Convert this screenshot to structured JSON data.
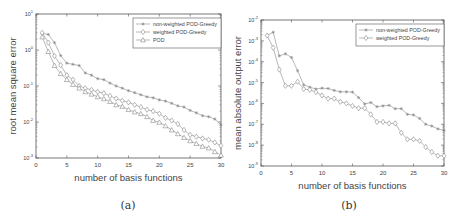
{
  "captions": {
    "a": "(a)",
    "b": "(b)"
  },
  "colors": {
    "axis": "#555555",
    "series": "#8a8a8a",
    "text": "#444444"
  },
  "chart_data": [
    {
      "id": "a",
      "type": "line",
      "yscale": "log",
      "title": "",
      "xlabel": "number of basis functions",
      "ylabel": "root mean square error",
      "xlim": [
        0,
        30
      ],
      "ylim": [
        0.001,
        10
      ],
      "xticks": [
        0,
        5,
        10,
        15,
        20,
        25,
        30
      ],
      "yticks": [
        {
          "value": 0.001,
          "label": "10",
          "exp": "-3"
        },
        {
          "value": 0.01,
          "label": "10",
          "exp": "-2"
        },
        {
          "value": 0.1,
          "label": "10",
          "exp": "-1"
        },
        {
          "value": 1,
          "label": "10",
          "exp": "0"
        },
        {
          "value": 10,
          "label": "10",
          "exp": "1"
        }
      ],
      "grid": false,
      "legend_position": "upper right",
      "x": [
        1,
        2,
        3,
        4,
        5,
        6,
        7,
        8,
        9,
        10,
        11,
        12,
        13,
        14,
        15,
        16,
        17,
        18,
        19,
        20,
        21,
        22,
        23,
        24,
        25,
        26,
        27,
        28,
        29,
        30
      ],
      "series": [
        {
          "name": "non-weighted POD-Greedy",
          "marker": "asterisk",
          "values": [
            2.9,
            2.7,
            1.6,
            0.7,
            0.43,
            0.4,
            0.37,
            0.23,
            0.2,
            0.16,
            0.15,
            0.12,
            0.1,
            0.087,
            0.074,
            0.065,
            0.057,
            0.05,
            0.047,
            0.041,
            0.038,
            0.033,
            0.028,
            0.026,
            0.021,
            0.018,
            0.015,
            0.014,
            0.012,
            0.0083
          ]
        },
        {
          "name": "weighted POD-Greedy",
          "marker": "diamond",
          "values": [
            3.0,
            1.6,
            0.68,
            0.38,
            0.2,
            0.15,
            0.1,
            0.087,
            0.078,
            0.069,
            0.063,
            0.053,
            0.045,
            0.039,
            0.035,
            0.03,
            0.026,
            0.022,
            0.02,
            0.017,
            0.013,
            0.011,
            0.0088,
            0.006,
            0.0044,
            0.0039,
            0.0035,
            0.0032,
            0.0027,
            0.0022
          ]
        },
        {
          "name": "POD",
          "marker": "triangle",
          "values": [
            2.3,
            0.9,
            0.37,
            0.22,
            0.15,
            0.11,
            0.087,
            0.069,
            0.059,
            0.05,
            0.044,
            0.037,
            0.03,
            0.027,
            0.022,
            0.019,
            0.017,
            0.014,
            0.011,
            0.0098,
            0.0078,
            0.006,
            0.0047,
            0.0037,
            0.003,
            0.0025,
            0.0021,
            0.0019,
            0.0015,
            0.0012
          ]
        }
      ]
    },
    {
      "id": "b",
      "type": "line",
      "yscale": "log",
      "title": "",
      "xlabel": "number of basis functions",
      "ylabel": "mean absolute output error",
      "xlim": [
        0,
        30
      ],
      "ylim": [
        1e-09,
        0.01
      ],
      "xticks": [
        0,
        5,
        10,
        15,
        20,
        25,
        30
      ],
      "yticks": [
        {
          "value": 1e-09,
          "label": "10",
          "exp": "-9"
        },
        {
          "value": 1e-08,
          "label": "10",
          "exp": "-8"
        },
        {
          "value": 1e-07,
          "label": "10",
          "exp": "-7"
        },
        {
          "value": 1e-06,
          "label": "10",
          "exp": "-6"
        },
        {
          "value": 1e-05,
          "label": "10",
          "exp": "-5"
        },
        {
          "value": 0.0001,
          "label": "10",
          "exp": "-4"
        },
        {
          "value": 0.001,
          "label": "10",
          "exp": "-3"
        },
        {
          "value": 0.01,
          "label": "10",
          "exp": "-2"
        }
      ],
      "grid": false,
      "legend_position": "upper right",
      "x": [
        1,
        2,
        3,
        4,
        5,
        6,
        7,
        8,
        9,
        10,
        11,
        12,
        13,
        14,
        15,
        16,
        17,
        18,
        19,
        20,
        21,
        22,
        23,
        24,
        25,
        26,
        27,
        28,
        29,
        30
      ],
      "series": [
        {
          "name": "non-weighted POD-Greedy",
          "marker": "asterisk",
          "values": [
            0.0018,
            0.0026,
            0.00019,
            0.00024,
            0.00016,
            3.7e-05,
            7.8e-06,
            6e-06,
            4.9e-06,
            5.4e-06,
            5.2e-06,
            4.2e-06,
            3.6e-06,
            3.6e-06,
            3.5e-06,
            1.9e-06,
            9.5e-07,
            1.1e-06,
            7e-07,
            7.6e-07,
            8.1e-07,
            5.6e-07,
            5.6e-07,
            3e-07,
            2.8e-07,
            1.9e-07,
            1e-07,
            8.2e-08,
            6e-08,
            5.1e-08
          ]
        },
        {
          "name": "weighted POD-Greedy",
          "marker": "diamond",
          "values": [
            0.0018,
            0.00047,
            4.2e-05,
            7e-06,
            7e-06,
            1.1e-05,
            4.9e-06,
            4.5e-06,
            3.5e-06,
            2.4e-06,
            1.7e-06,
            1.7e-06,
            1.2e-06,
            1e-06,
            7.6e-07,
            5.9e-07,
            5.9e-07,
            3e-07,
            1.3e-07,
            1.3e-07,
            1.1e-07,
            1.1e-07,
            3.9e-08,
            1.9e-08,
            1.9e-08,
            1.6e-08,
            8.1e-09,
            4.7e-09,
            3.1e-09,
            3.1e-09
          ]
        }
      ]
    }
  ]
}
